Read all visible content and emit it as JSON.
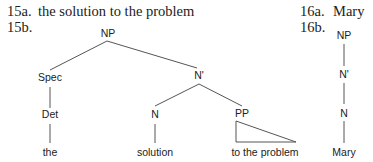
{
  "ex15": {
    "a_label": "15a.",
    "a_text": "the solution to the problem",
    "b_label": "15b.",
    "tree": {
      "np": "NP",
      "spec": "Spec",
      "nbar": "N'",
      "det": "Det",
      "n": "N",
      "pp": "PP",
      "the": "the",
      "solution": "solution",
      "pp_words": "to the problem"
    }
  },
  "ex16": {
    "a_label": "16a.",
    "a_text": "Mary",
    "b_label": "16b.",
    "tree": {
      "np": "NP",
      "nbar": "N'",
      "n": "N",
      "word": "Mary"
    }
  }
}
